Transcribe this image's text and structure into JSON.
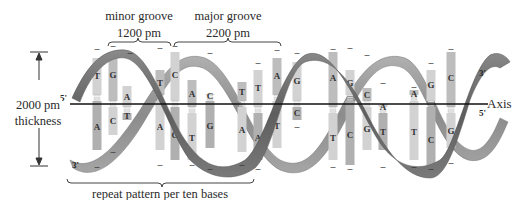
{
  "labels": {
    "minor_groove_title": "minor groove",
    "minor_groove_value": "1200 pm",
    "major_groove_title": "major groove",
    "major_groove_value": "2200 pm",
    "thickness_value": "2000 pm",
    "thickness_title": "thickness",
    "axis": "Axis",
    "repeat": "repeat pattern per ten bases",
    "five_prime_left": "5'",
    "three_prime_left": "3'",
    "three_prime_right": "3'",
    "five_prime_right": "5'"
  },
  "colors": {
    "backbone_dark": "#6e6e6e",
    "backbone_light": "#9a9a9a",
    "base_light": "#cfcfcf",
    "base_dark": "#a9a9a9",
    "axis_line": "#111111"
  },
  "base_pairs": [
    {
      "x": 97,
      "top": "T",
      "bottom": "A"
    },
    {
      "x": 113,
      "top": "G",
      "bottom": "C"
    },
    {
      "x": 127,
      "top": "A",
      "bottom": "T"
    },
    {
      "x": 160,
      "top": "T",
      "bottom": "A"
    },
    {
      "x": 175,
      "top": "C",
      "bottom": "G"
    },
    {
      "x": 192,
      "top": "A",
      "bottom": "T"
    },
    {
      "x": 210,
      "top": "C",
      "bottom": "G"
    },
    {
      "x": 242,
      "top": "T",
      "bottom": "A"
    },
    {
      "x": 258,
      "top": "T",
      "bottom": "A"
    },
    {
      "x": 277,
      "top": "A",
      "bottom": "T"
    },
    {
      "x": 297,
      "top": "G",
      "bottom": "C"
    },
    {
      "x": 333,
      "top": "A",
      "bottom": "T"
    },
    {
      "x": 350,
      "top": "G",
      "bottom": "C"
    },
    {
      "x": 367,
      "top": "C",
      "bottom": "G"
    },
    {
      "x": 383,
      "top": "A",
      "bottom": "T"
    },
    {
      "x": 414,
      "top": "A",
      "bottom": "T"
    },
    {
      "x": 431,
      "top": "G",
      "bottom": "C"
    },
    {
      "x": 451,
      "top": "C",
      "bottom": "G"
    }
  ]
}
